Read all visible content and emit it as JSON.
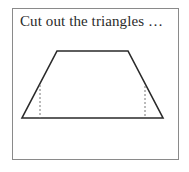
{
  "caption": "Cut out the triangles …",
  "figure": {
    "shape": "trapezoid",
    "vertices": {
      "top_left": [
        57,
        51
      ],
      "top_right": [
        128,
        51
      ],
      "bottom_right": [
        163,
        118
      ],
      "bottom_left": [
        22,
        118
      ]
    },
    "dashed_lines": [
      {
        "x": 40,
        "y1": 85,
        "y2": 118
      },
      {
        "x": 145,
        "y1": 86,
        "y2": 118
      }
    ],
    "stroke_color": "#2a2a2a",
    "dashed_color": "#777777",
    "frame_color": "#8a8a8a"
  }
}
